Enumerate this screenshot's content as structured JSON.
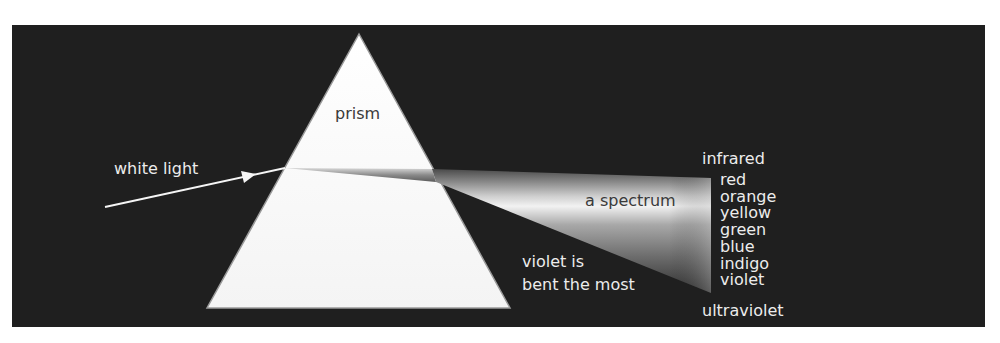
{
  "diagram": {
    "type": "prism-dispersion",
    "labels": {
      "prism": "prism",
      "incoming": "white light",
      "spectrum": "a spectrum",
      "note_line1": "violet is",
      "note_line2": "bent the most",
      "above_spectrum": "infrared",
      "below_spectrum": "ultraviolet"
    },
    "spectrum_colors": [
      "red",
      "orange",
      "yellow",
      "green",
      "blue",
      "indigo",
      "violet"
    ],
    "palette": {
      "background": "#1f1f1f",
      "prism": "#ffffff",
      "text": "#ececec",
      "label_on_light": "#3a3a3a"
    }
  }
}
